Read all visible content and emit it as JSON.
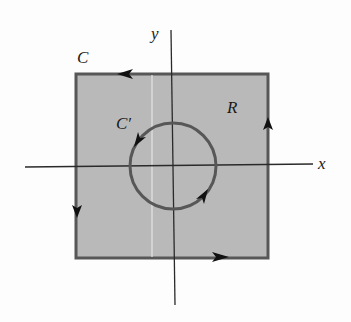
{
  "figure": {
    "type": "region-with-hole-diagram",
    "labels": {
      "y_axis": "y",
      "x_axis": "x",
      "outer_curve": "C",
      "inner_curve": "C′",
      "region": "R"
    },
    "colors": {
      "region_fill": "#b9b9b9",
      "curve_stroke": "#575757",
      "axis_stroke": "#2a2a2a",
      "background": "#fdfdfd"
    },
    "outer_curve": {
      "shape": "square",
      "orientation": "counterclockwise",
      "arrows": [
        "top-left",
        "right-up",
        "left-down",
        "bottom-right"
      ]
    },
    "inner_curve": {
      "shape": "circle",
      "orientation": "clockwise",
      "arrows": [
        "upper-left-down",
        "lower-right-up"
      ]
    }
  }
}
